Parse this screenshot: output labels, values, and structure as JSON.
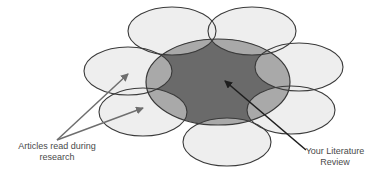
{
  "diagram": {
    "title": "",
    "labels": {
      "articles_line1": "Articles read during",
      "articles_line2": "research",
      "review_line1": "Your Literature",
      "review_line2": "Review"
    },
    "colors": {
      "background": "#ffffff",
      "petal_fill": "#ececec",
      "petal_stroke": "#3a3a3a",
      "overlap_fill": "#a9a9a9",
      "core_fill": "#6a6a6a",
      "arrow_gray": "#6e6e6e",
      "arrow_dark": "#1e1e1e",
      "text": "#4a4a4a"
    },
    "central_ellipse": {
      "name": "Your Literature Review",
      "cx": 218,
      "cy": 82,
      "rx": 72,
      "ry": 43
    },
    "petals": [
      {
        "name": "article-top-left",
        "cx": 172,
        "cy": 31,
        "rx": 44,
        "ry": 24
      },
      {
        "name": "article-top-right",
        "cx": 252,
        "cy": 31,
        "rx": 44,
        "ry": 24
      },
      {
        "name": "article-left-upper",
        "cx": 128,
        "cy": 71,
        "rx": 44,
        "ry": 24
      },
      {
        "name": "article-left-lower",
        "cx": 143,
        "cy": 112,
        "rx": 44,
        "ry": 24
      },
      {
        "name": "article-bottom",
        "cx": 227,
        "cy": 142,
        "rx": 44,
        "ry": 24
      },
      {
        "name": "article-right-upper",
        "cx": 299,
        "cy": 67,
        "rx": 44,
        "ry": 24
      },
      {
        "name": "article-right-lower",
        "cx": 291,
        "cy": 110,
        "rx": 44,
        "ry": 24
      }
    ],
    "arrows": [
      {
        "name": "articles-arrow-upper",
        "from": [
          57,
          140
        ],
        "to": [
          128,
          74
        ]
      },
      {
        "name": "articles-arrow-lower",
        "from": [
          57,
          140
        ],
        "to": [
          143,
          108
        ]
      },
      {
        "name": "review-arrow",
        "from": [
          306,
          150
        ],
        "to": [
          225,
          81
        ]
      }
    ]
  }
}
